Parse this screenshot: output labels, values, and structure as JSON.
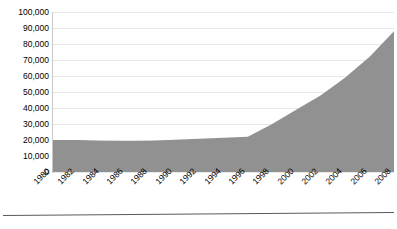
{
  "chart_data": {
    "type": "area",
    "title": "",
    "subtitle": "",
    "xlabel": "",
    "ylabel": "",
    "categories": [
      "1980",
      "1982",
      "1984",
      "1986",
      "1988",
      "1990",
      "1992",
      "1994",
      "1996",
      "1998",
      "2000",
      "2002",
      "2004",
      "2006",
      "2008"
    ],
    "values": [
      20000,
      20000,
      19600,
      19400,
      19600,
      20200,
      20800,
      21400,
      22000,
      30000,
      39000,
      48000,
      59000,
      72000,
      88000
    ],
    "series": [
      {
        "name": "",
        "values": [
          20000,
          20000,
          19600,
          19400,
          19600,
          20200,
          20800,
          21400,
          22000,
          30000,
          39000,
          48000,
          59000,
          72000,
          88000
        ]
      }
    ],
    "ylim": [
      0,
      100000
    ],
    "xlim": [
      "1980",
      "2008"
    ],
    "y_ticks": [
      0,
      10000,
      20000,
      30000,
      40000,
      50000,
      60000,
      70000,
      80000,
      90000,
      100000
    ],
    "y_tick_labels": [
      "0",
      "10,000",
      "20,000",
      "30,000",
      "40,000",
      "50,000",
      "60,000",
      "70,000",
      "80,000",
      "90,000",
      "100,000"
    ],
    "x_tick_labels": [
      "1980",
      "1982",
      "1984",
      "1986",
      "1988",
      "1990",
      "1992",
      "1994",
      "1996",
      "1998",
      "2000",
      "2002",
      "2004",
      "2006",
      "2008"
    ],
    "grid": true,
    "grid_axis": "y",
    "legend": false,
    "legend_position": "none",
    "annotations": [],
    "colors": {
      "area_fill": "#919191",
      "gridline": "#e8e8e8",
      "axis_line": "#5a5a5a",
      "y_axis_line": "#c9c9c9",
      "text": "#000000",
      "background": "#ffffff"
    }
  }
}
